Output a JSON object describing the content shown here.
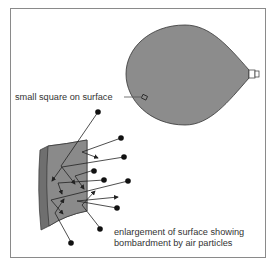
{
  "diagram": {
    "labels": {
      "small_square": "small square on surface",
      "enlargement_line1": "enlargement of surface showing",
      "enlargement_line2": "bombardment by air particles"
    },
    "colors": {
      "balloon_fill": "#8c8c8c",
      "surface_fill": "#8a8a8a",
      "surface_edge": "#6f6f6f",
      "particle": "#111111",
      "line": "#222222",
      "frame_border": "#8a8a8a",
      "text": "#333333"
    }
  }
}
